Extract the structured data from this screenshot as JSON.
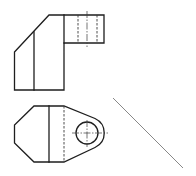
{
  "drawing": {
    "type": "orthographic-projection",
    "views": [
      {
        "id": "front-view",
        "description": "Front view of bracket with chamfered block and projecting lug",
        "features": [
          "chamfered-edge",
          "vertical-edge-line",
          "lug",
          "hidden-hole-edges",
          "hole-centerline"
        ]
      },
      {
        "id": "top-view",
        "description": "Top view showing chamfered left end, rounded lug with through hole",
        "features": [
          "chamfered-corners",
          "vertical-edge-line",
          "hidden-edge-line",
          "rounded-lug",
          "through-hole",
          "hole-centerlines"
        ]
      }
    ],
    "miter_line": {
      "angle_deg": 45,
      "purpose": "projection construction line"
    },
    "colors": {
      "outline": "#1e1e1e",
      "hidden": "#3a3a3a",
      "center": "#3a3a3a",
      "miter": "#7a7a7a",
      "background": "#ffffff"
    }
  }
}
